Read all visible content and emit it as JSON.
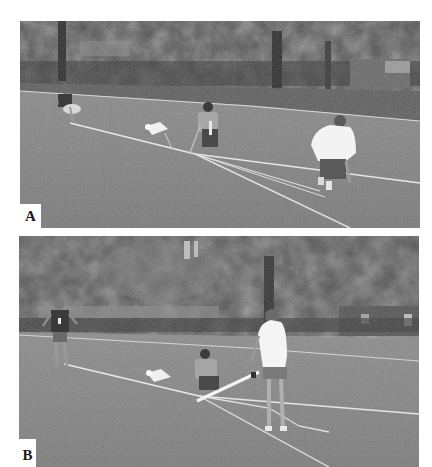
{
  "figure": {
    "panels": [
      {
        "id": "A",
        "label": "A",
        "description": "Four people on a grass field laying out long white tape measures/strings radiating from a point; one crouching at left, one kneeling center, one in white shirt crouching right; small white object (parachute/rocket) on grass; trees and fence in background",
        "colors": {
          "grass": "#7d7d7d",
          "trees": "#3e3e3e",
          "tape": "#e6e6e6",
          "shirt": "#f2f2f2"
        }
      },
      {
        "id": "B",
        "label": "B",
        "description": "Same field; person standing at left with lanyard, person crouching center, person in white shirt and shorts standing holding a white pole/launcher angled on the ground; white tapes on the grass; trees and buildings in background",
        "colors": {
          "grass": "#7f7f7f",
          "trees": "#454545",
          "tape": "#e6e6e6",
          "shirt": "#f4f4f4"
        }
      }
    ]
  }
}
